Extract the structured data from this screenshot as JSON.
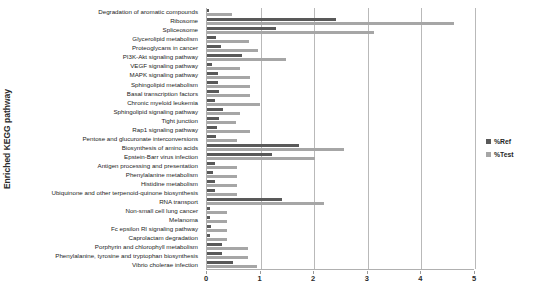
{
  "chart_data": {
    "type": "bar",
    "orientation": "horizontal",
    "title": "",
    "xlabel": "",
    "ylabel": "Enriched KEGG pathway",
    "xlim": [
      0,
      5
    ],
    "xticks": [
      0,
      1,
      2,
      3,
      4,
      5
    ],
    "grid": true,
    "legend_position": "right",
    "categories": [
      "Degradation of aromatic compounds",
      "Ribosome",
      "Spliceosome",
      "Glycerolipid metabolism",
      "Proteoglycans in cancer",
      "PI3K-Akt signaling pathway",
      "VEGF signaling pathway",
      "MAPK signaling pathway",
      "Sphingolipid metabolism",
      "Basal transcription factors",
      "Chronic myeloid leukemia",
      "Sphingolipid signaling pathway",
      "Tight junction",
      "Rap1 signaling pathway",
      "Pentose and glucuronate interconversions",
      "Biosynthesis of amino acids",
      "Epstein-Barr virus infection",
      "Antigen processing and presentation",
      "Phenylalanine metabolism",
      "Histidine metabolism",
      "Ubiquinone and other terpenoid-quinone biosynthesis",
      "RNA transport",
      "Non-small cell lung cancer",
      "Melanoma",
      "Fc epsilon RI signaling pathway",
      "Caprolactam degradation",
      "Porphyrin and chlorophyll metabolism",
      "Phenylalanine, tyrosine and tryptophan biosynthesis",
      "Vibrio cholerae infection"
    ],
    "series": [
      {
        "name": "%Ref",
        "color": "#595959",
        "values": [
          0.04,
          2.4,
          1.28,
          0.17,
          0.26,
          0.66,
          0.1,
          0.2,
          0.2,
          0.22,
          0.14,
          0.3,
          0.22,
          0.18,
          0.17,
          1.72,
          1.22,
          0.14,
          0.12,
          0.14,
          0.14,
          1.4,
          0.06,
          0.06,
          0.07,
          0.06,
          0.28,
          0.28,
          0.48
        ]
      },
      {
        "name": "%Test",
        "color": "#a6a6a6",
        "values": [
          0.46,
          4.6,
          3.12,
          0.78,
          0.96,
          1.48,
          0.62,
          0.8,
          0.8,
          0.8,
          0.98,
          0.62,
          0.54,
          0.8,
          0.56,
          2.56,
          2.02,
          0.56,
          0.56,
          0.56,
          0.56,
          2.18,
          0.38,
          0.38,
          0.38,
          0.38,
          0.76,
          0.76,
          0.94
        ]
      }
    ]
  },
  "legend": {
    "items": [
      {
        "label": "%Ref"
      },
      {
        "label": "%Test"
      }
    ]
  }
}
